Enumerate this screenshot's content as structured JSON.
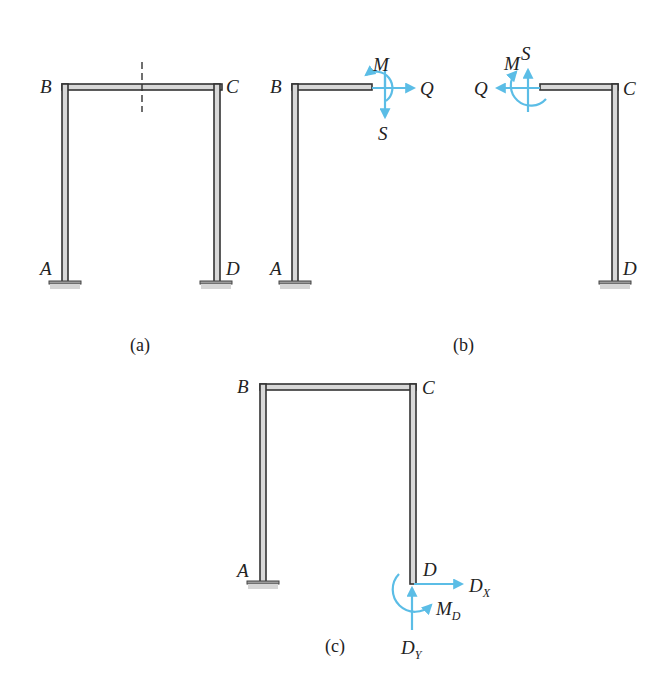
{
  "figure": {
    "panels": [
      {
        "id": "a",
        "caption": "(a)",
        "description": "Fixed-base portal frame ABCD with section cut marked on beam BC",
        "labels": {
          "A": "A",
          "B": "B",
          "C": "C",
          "D": "D"
        },
        "section_cut": "dashed line at mid-span of BC"
      },
      {
        "id": "b",
        "caption": "(b)",
        "description": "Free-body diagrams of the two halves after cutting beam BC",
        "left_part": {
          "labels": {
            "A": "A",
            "B": "B"
          },
          "forces": {
            "moment": "M",
            "axial": "Q",
            "shear": "S"
          }
        },
        "right_part": {
          "labels": {
            "C": "C",
            "D": "D"
          },
          "forces": {
            "moment": "M",
            "axial": "Q",
            "shear": "S"
          }
        }
      },
      {
        "id": "c",
        "caption": "(c)",
        "description": "Frame with support D released, replaced by reactions",
        "labels": {
          "A": "A",
          "B": "B",
          "C": "C",
          "D": "D"
        },
        "reactions": {
          "horizontal": {
            "main": "D",
            "sub": "X"
          },
          "vertical": {
            "main": "D",
            "sub": "Y"
          },
          "moment": {
            "main": "M",
            "sub": "D"
          }
        }
      }
    ],
    "colors": {
      "force_arrows": "#5bbde6",
      "member_fill": "#d8d8d8",
      "member_outline": "#333333"
    }
  }
}
